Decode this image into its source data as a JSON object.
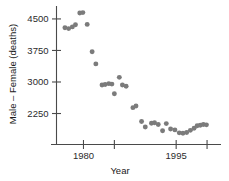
{
  "chart_data": {
    "type": "scatter",
    "title": "",
    "xlabel": "Year",
    "ylabel": "Male – Female (deaths)",
    "xlim": [
      1976.2,
      2000.8
    ],
    "ylim": [
      1620,
      4760
    ],
    "grid": false,
    "legend": null,
    "marker_color": "#7b7b7b",
    "axis_color": "#4a4a4a",
    "x_ticks": [
      1980,
      1985,
      1995,
      2000
    ],
    "x_tick_labels": [
      "1980",
      "",
      "1995",
      ""
    ],
    "y_ticks": [
      2250,
      3000,
      3750,
      4500
    ],
    "y_tick_labels": [
      "2250",
      "3000",
      "3750",
      "4500"
    ],
    "points": [
      {
        "x": 1977.0,
        "y": 4290
      },
      {
        "x": 1977.6,
        "y": 4270
      },
      {
        "x": 1978.2,
        "y": 4310
      },
      {
        "x": 1978.7,
        "y": 4360
      },
      {
        "x": 1979.4,
        "y": 4640
      },
      {
        "x": 1979.9,
        "y": 4650
      },
      {
        "x": 1980.6,
        "y": 4370
      },
      {
        "x": 1981.4,
        "y": 3720
      },
      {
        "x": 1982.0,
        "y": 3430
      },
      {
        "x": 1983.0,
        "y": 2930
      },
      {
        "x": 1983.5,
        "y": 2940
      },
      {
        "x": 1984.1,
        "y": 2960
      },
      {
        "x": 1984.6,
        "y": 2950
      },
      {
        "x": 1985.0,
        "y": 2720
      },
      {
        "x": 1985.8,
        "y": 3110
      },
      {
        "x": 1986.3,
        "y": 2930
      },
      {
        "x": 1986.9,
        "y": 2900
      },
      {
        "x": 1988.0,
        "y": 2390
      },
      {
        "x": 1988.5,
        "y": 2430
      },
      {
        "x": 1989.4,
        "y": 2060
      },
      {
        "x": 1990.0,
        "y": 1930
      },
      {
        "x": 1991.0,
        "y": 2020
      },
      {
        "x": 1991.5,
        "y": 2030
      },
      {
        "x": 1992.1,
        "y": 1990
      },
      {
        "x": 1992.8,
        "y": 1840
      },
      {
        "x": 1993.4,
        "y": 2010
      },
      {
        "x": 1994.1,
        "y": 1880
      },
      {
        "x": 1994.8,
        "y": 1860
      },
      {
        "x": 1995.5,
        "y": 1790
      },
      {
        "x": 1996.1,
        "y": 1780
      },
      {
        "x": 1996.7,
        "y": 1800
      },
      {
        "x": 1997.3,
        "y": 1850
      },
      {
        "x": 1997.9,
        "y": 1900
      },
      {
        "x": 1998.4,
        "y": 1960
      },
      {
        "x": 1998.9,
        "y": 1970
      },
      {
        "x": 1999.4,
        "y": 1990
      },
      {
        "x": 1999.9,
        "y": 1980
      }
    ]
  }
}
